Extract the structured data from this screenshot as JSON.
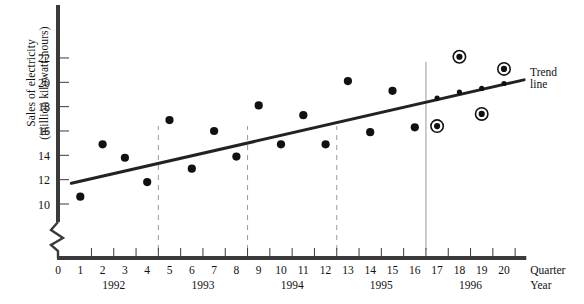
{
  "chart_data": {
    "type": "scatter",
    "title": "",
    "xlabel_primary": "Quarter",
    "xlabel_secondary": "Year",
    "ylabel_line1": "Sales of electricity",
    "ylabel_line2": "(million kilowatt-hours)",
    "ylim": [
      9,
      23
    ],
    "yticks": [
      10,
      12,
      14,
      16,
      18,
      20,
      22
    ],
    "ytick_labels": [
      "10",
      "12",
      "14",
      "16",
      "18",
      "20",
      "22"
    ],
    "xlim": [
      0,
      21
    ],
    "xticks": [
      0,
      1,
      2,
      3,
      4,
      5,
      6,
      7,
      8,
      9,
      10,
      11,
      12,
      13,
      14,
      15,
      16,
      17,
      18,
      19,
      20
    ],
    "xtick_labels": [
      "0",
      "1",
      "2",
      "3",
      "4",
      "5",
      "6",
      "7",
      "8",
      "9",
      "10",
      "11",
      "12",
      "13",
      "14",
      "15",
      "16",
      "17",
      "18",
      "19",
      "20"
    ],
    "axis_break": true,
    "grid": false,
    "legend": "none",
    "year_groups": [
      {
        "label": "1992",
        "start_quarter": 1,
        "end_quarter": 4
      },
      {
        "label": "1993",
        "start_quarter": 5,
        "end_quarter": 8
      },
      {
        "label": "1994",
        "start_quarter": 9,
        "end_quarter": 12
      },
      {
        "label": "1995",
        "start_quarter": 13,
        "end_quarter": 16
      },
      {
        "label": "1996",
        "start_quarter": 17,
        "end_quarter": 20
      }
    ],
    "year_dividers": [
      4.5,
      8.5,
      12.5
    ],
    "forecast_divider": 16.5,
    "series": [
      {
        "name": "Observed sales",
        "marker": "filled-circle",
        "x": [
          1,
          2,
          3,
          4,
          5,
          6,
          7,
          8,
          9,
          10,
          11,
          12,
          13,
          14,
          15,
          16
        ],
        "values": [
          10.6,
          14.9,
          13.8,
          11.8,
          16.9,
          12.9,
          16.0,
          13.9,
          18.1,
          14.9,
          17.3,
          14.9,
          20.1,
          15.9,
          19.3,
          16.3
        ]
      },
      {
        "name": "Forecast actuals (circled)",
        "marker": "circled-dot",
        "x": [
          17,
          18,
          19,
          20
        ],
        "values": [
          16.4,
          22.1,
          17.4,
          21.1
        ]
      },
      {
        "name": "Trend line fitted values",
        "marker": "small-dot",
        "x": [
          17,
          18,
          19,
          20
        ],
        "values": [
          18.7,
          19.2,
          19.5,
          19.9
        ]
      }
    ],
    "trend_line": {
      "label_line1": "Trend",
      "label_line2": "line",
      "x_start": 0.6,
      "y_start": 11.7,
      "x_end": 20.9,
      "y_end": 20.2
    },
    "colors": {
      "axis": "#3a3a3a",
      "marker": "#111111",
      "trend": "#222222",
      "divider_dashed": "#9a9a9a",
      "divider_solid": "#9a9a9a",
      "background": "#ffffff"
    }
  }
}
